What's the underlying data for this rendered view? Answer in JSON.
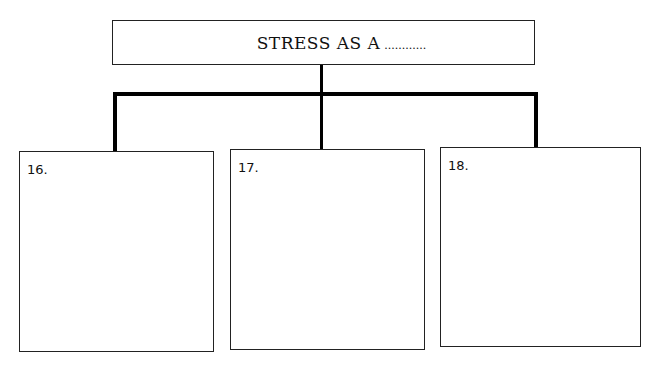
{
  "title": {
    "text": "STRESS AS A",
    "dots": "............"
  },
  "boxes": [
    {
      "label": "16."
    },
    {
      "label": "17."
    },
    {
      "label": "18."
    }
  ]
}
